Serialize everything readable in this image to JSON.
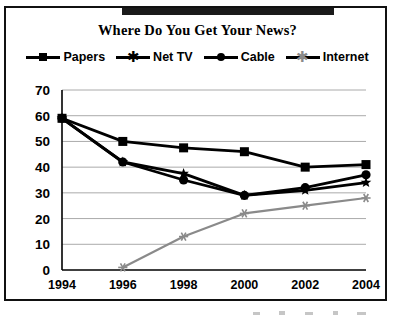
{
  "chart": {
    "title": "Where Do You Get Your News?",
    "axis": {
      "y_ticks": [
        70,
        60,
        50,
        40,
        30,
        20,
        10,
        0
      ],
      "x_ticks": [
        "1994",
        "1996",
        "1998",
        "2000",
        "2002",
        "2004"
      ]
    },
    "legend": [
      {
        "label": "Papers",
        "marker": "square-marker-icon"
      },
      {
        "label": "Net TV",
        "marker": "star-marker-icon"
      },
      {
        "label": "Cable",
        "marker": "circle-marker-icon"
      },
      {
        "label": "Internet",
        "marker": "asterisk-marker-icon"
      }
    ]
  },
  "chart_data": {
    "type": "line",
    "title": "Where Do You Get Your News?",
    "xlabel": "",
    "ylabel": "",
    "categories": [
      "1994",
      "1996",
      "1998",
      "2000",
      "2002",
      "2004"
    ],
    "ylim": [
      0,
      70
    ],
    "ytick_step": 10,
    "grid": true,
    "legend_position": "top",
    "series": [
      {
        "name": "Papers",
        "marker": "square",
        "color": "#000000",
        "values": [
          59,
          50,
          47.5,
          46,
          40,
          41
        ]
      },
      {
        "name": "Net TV",
        "marker": "star",
        "color": "#000000",
        "values": [
          59,
          42,
          37.5,
          29,
          31,
          34
        ]
      },
      {
        "name": "Cable",
        "marker": "circle",
        "color": "#000000",
        "values": [
          59,
          42,
          35,
          29,
          32,
          37
        ]
      },
      {
        "name": "Internet",
        "marker": "asterisk",
        "color": "#8a8a8a",
        "values": [
          null,
          1,
          13,
          22,
          25,
          28
        ]
      }
    ]
  }
}
